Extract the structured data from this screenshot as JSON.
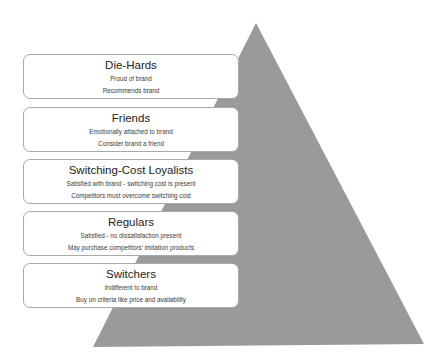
{
  "diagram": {
    "type": "pyramid",
    "title": "",
    "colors": {
      "pyramid_fill": "#9a9a9a",
      "box_fill": "#ffffff",
      "box_border": "#a9a9a9",
      "text": "#2a2a2a"
    },
    "tiers": [
      {
        "title": "Die-Hards",
        "lines": [
          "Proud of brand",
          "Recommends brand"
        ]
      },
      {
        "title": "Friends",
        "lines": [
          "Emotionally attached to brand",
          "Consider brand a friend"
        ]
      },
      {
        "title": "Switching-Cost Loyalists",
        "lines": [
          "Satisfied with brand - switching cost is present",
          "Competitors must overcome switching cost"
        ]
      },
      {
        "title": "Regulars",
        "lines": [
          "Satisfied - no dissatisfaction present",
          "May purchase competitors' imitation products"
        ]
      },
      {
        "title": "Switchers",
        "lines": [
          "Indifferent to brand",
          "Buy on criteria like price and availability"
        ]
      }
    ]
  }
}
